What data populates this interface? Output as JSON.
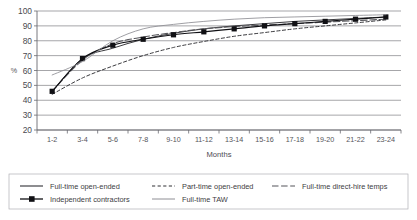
{
  "chart_data": {
    "type": "line",
    "title": "",
    "xlabel": "Months",
    "ylabel": "%",
    "ylim": [
      20,
      100
    ],
    "yticks": [
      20,
      30,
      40,
      50,
      60,
      70,
      80,
      90,
      100
    ],
    "grid": true,
    "legend_position": "bottom",
    "categories": [
      "1-2",
      "3-4",
      "5-6",
      "7-8",
      "9-10",
      "11-12",
      "13-14",
      "15-16",
      "17-18",
      "19-20",
      "21-22",
      "23-24"
    ],
    "series": [
      {
        "name": "Full-time open-ended",
        "style": "solid",
        "color": "#303035",
        "values": [
          46,
          68,
          75,
          81,
          85,
          88,
          90,
          91.5,
          93,
          94,
          95,
          96
        ]
      },
      {
        "name": "Part-time open-ended",
        "style": "dashed",
        "color": "#303035",
        "values": [
          44,
          55,
          63,
          70,
          75.5,
          79.5,
          83,
          85.5,
          88,
          90,
          92,
          94
        ]
      },
      {
        "name": "Full-time direct-hire temps",
        "style": "long-dash",
        "color": "#55555a",
        "values": [
          46,
          67,
          78,
          82.5,
          85.5,
          88,
          89.5,
          90.5,
          91.5,
          92.5,
          93.5,
          94.5
        ]
      },
      {
        "name": "Independent contractors",
        "style": "solid-marker",
        "color": "#101014",
        "marker": "square",
        "values": [
          46,
          68,
          77,
          81,
          84,
          86,
          88,
          90,
          91.5,
          93,
          94.5,
          96
        ]
      },
      {
        "name": "Full-time TAW",
        "style": "solid-light",
        "color": "#8e8e94",
        "values": [
          57,
          66,
          80,
          88,
          91,
          93,
          94.5,
          95.5,
          96,
          96.5,
          97,
          97.5
        ]
      }
    ]
  },
  "legend": {
    "entries": [
      {
        "label": "Full-time open-ended"
      },
      {
        "label": "Part-time open-ended"
      },
      {
        "label": "Full-time direct-hire temps"
      },
      {
        "label": "Independent contractors"
      },
      {
        "label": "Full-time TAW"
      }
    ]
  }
}
